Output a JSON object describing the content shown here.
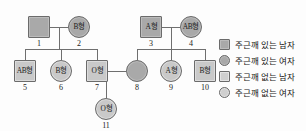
{
  "diagram": {
    "type": "pedigree-chart",
    "title": "",
    "individuals": [
      {
        "id": "1",
        "sex": "male",
        "shape": "square",
        "blood_type": "",
        "affected": true,
        "x": 28,
        "y": 16
      },
      {
        "id": "2",
        "sex": "female",
        "shape": "circle",
        "blood_type": "B형",
        "affected": true,
        "x": 68,
        "y": 16
      },
      {
        "id": "3",
        "sex": "male",
        "shape": "square",
        "blood_type": "A형",
        "affected": true,
        "x": 140,
        "y": 16
      },
      {
        "id": "4",
        "sex": "female",
        "shape": "circle",
        "blood_type": "AB형",
        "affected": true,
        "x": 180,
        "y": 16
      },
      {
        "id": "5",
        "sex": "male",
        "shape": "square",
        "blood_type": "AB형",
        "affected": false,
        "x": 14,
        "y": 60
      },
      {
        "id": "6",
        "sex": "female",
        "shape": "circle",
        "blood_type": "B형",
        "affected": false,
        "x": 50,
        "y": 60
      },
      {
        "id": "7",
        "sex": "male",
        "shape": "square",
        "blood_type": "O형",
        "affected": false,
        "x": 86,
        "y": 60
      },
      {
        "id": "8",
        "sex": "female",
        "shape": "circle",
        "blood_type": "",
        "affected": true,
        "x": 126,
        "y": 60
      },
      {
        "id": "9",
        "sex": "female",
        "shape": "circle",
        "blood_type": "A형",
        "affected": false,
        "x": 160,
        "y": 60
      },
      {
        "id": "10",
        "sex": "male",
        "shape": "square",
        "blood_type": "B형",
        "affected": false,
        "x": 194,
        "y": 60
      },
      {
        "id": "11",
        "sex": "female",
        "shape": "circle",
        "blood_type": "O형",
        "affected": false,
        "x": 95,
        "y": 98
      }
    ]
  },
  "legend": {
    "items": [
      {
        "symbol": "square",
        "fill": "dark",
        "label": "주근깨 있는 남자"
      },
      {
        "symbol": "circle",
        "fill": "dark",
        "label": "주근깨 있는 여자"
      },
      {
        "symbol": "square",
        "fill": "light",
        "label": "주근깨 없는 남자"
      },
      {
        "symbol": "circle",
        "fill": "light",
        "label": "주근깨 없는 여자"
      }
    ]
  },
  "colors": {
    "line": "#6f6f6f",
    "symbol_border": "#6b6b6b",
    "affected_fill": "#a9a9a9",
    "unaffected_fill": "#c9c9c9",
    "background": "#fdfdfd",
    "text": "#141414"
  }
}
